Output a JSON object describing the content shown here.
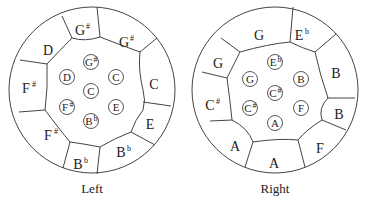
{
  "figure": {
    "left": {
      "caption": "Left",
      "outer_notes": [
        {
          "base": "D",
          "acc": "",
          "x": 48,
          "y": 50
        },
        {
          "base": "G",
          "acc": "#",
          "x": 82,
          "y": 30
        },
        {
          "base": "G",
          "acc": "#",
          "x": 126,
          "y": 42
        },
        {
          "base": "C",
          "acc": "",
          "x": 154,
          "y": 84
        },
        {
          "base": "E",
          "acc": "",
          "x": 150,
          "y": 124
        },
        {
          "base": "B",
          "acc": "b",
          "x": 123,
          "y": 152
        },
        {
          "base": "B",
          "acc": "b",
          "x": 80,
          "y": 164
        },
        {
          "base": "F",
          "acc": "#",
          "x": 50,
          "y": 135
        },
        {
          "base": "F",
          "acc": "#",
          "x": 28,
          "y": 88
        }
      ],
      "inner_notes": [
        {
          "base": "G",
          "acc": "#",
          "x": 91,
          "y": 62
        },
        {
          "base": "D",
          "acc": "",
          "x": 67,
          "y": 77
        },
        {
          "base": "C",
          "acc": "",
          "x": 116,
          "y": 77
        },
        {
          "base": "C",
          "acc": "",
          "x": 91,
          "y": 91
        },
        {
          "base": "F",
          "acc": "#",
          "x": 67,
          "y": 107
        },
        {
          "base": "E",
          "acc": "",
          "x": 116,
          "y": 107
        },
        {
          "base": "B",
          "acc": "b",
          "x": 91,
          "y": 121
        }
      ]
    },
    "right": {
      "caption": "Right",
      "outer_notes": [
        {
          "base": "G",
          "acc": "",
          "x": 259,
          "y": 35
        },
        {
          "base": "E",
          "acc": "b",
          "x": 301,
          "y": 35
        },
        {
          "base": "B",
          "acc": "",
          "x": 336,
          "y": 73
        },
        {
          "base": "B",
          "acc": "",
          "x": 339,
          "y": 114
        },
        {
          "base": "F",
          "acc": "",
          "x": 320,
          "y": 148
        },
        {
          "base": "A",
          "acc": "",
          "x": 274,
          "y": 163
        },
        {
          "base": "A",
          "acc": "",
          "x": 235,
          "y": 146
        },
        {
          "base": "C",
          "acc": "#",
          "x": 212,
          "y": 105
        },
        {
          "base": "G",
          "acc": "",
          "x": 218,
          "y": 63
        }
      ],
      "inner_notes": [
        {
          "base": "E",
          "acc": "b",
          "x": 275,
          "y": 62
        },
        {
          "base": "G",
          "acc": "",
          "x": 250,
          "y": 79
        },
        {
          "base": "B",
          "acc": "",
          "x": 301,
          "y": 79
        },
        {
          "base": "C",
          "acc": "#",
          "x": 275,
          "y": 93
        },
        {
          "base": "C",
          "acc": "#",
          "x": 250,
          "y": 108
        },
        {
          "base": "F",
          "acc": "",
          "x": 301,
          "y": 108
        },
        {
          "base": "A",
          "acc": "",
          "x": 275,
          "y": 123
        }
      ]
    }
  }
}
